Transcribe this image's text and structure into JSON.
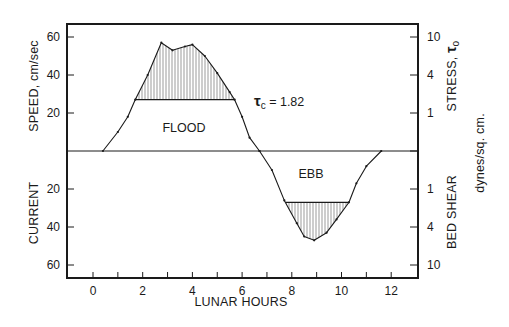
{
  "chart_data": {
    "type": "line",
    "title": "",
    "xlabel": "LUNAR HOURS",
    "ylabel_left_top": "SPEED, cm/sec",
    "ylabel_left_bottom": "CURRENT",
    "ylabel_right_top": "STRESS, τo",
    "ylabel_right_bottom": "BED SHEAR",
    "ylabel_right_units": "dynes/sq. cm.",
    "xlim": [
      -1,
      13
    ],
    "ylim": [
      -68,
      68
    ],
    "x_ticks": [
      0,
      2,
      4,
      6,
      8,
      10,
      12
    ],
    "x_minor_ticks": [
      0,
      1,
      2,
      3,
      4,
      5,
      6,
      7,
      8,
      9,
      10,
      11,
      12
    ],
    "y_ticks_left_flood": [
      20,
      40,
      60
    ],
    "y_ticks_left_ebb": [
      20,
      40,
      60
    ],
    "y_ticks_right_flood": [
      {
        "label": "1",
        "speed": 20
      },
      {
        "label": "4",
        "speed": 40
      },
      {
        "label": "10",
        "speed": 60
      }
    ],
    "y_ticks_right_ebb": [
      {
        "label": "1",
        "speed": 20
      },
      {
        "label": "4",
        "speed": 40
      },
      {
        "label": "10",
        "speed": 60
      }
    ],
    "grid": false,
    "threshold_speed": 27,
    "annotations": [
      {
        "text": "FLOOD",
        "x": 3.9,
        "y": 12
      },
      {
        "text": "EBB",
        "x": 8.8,
        "y": -14
      },
      {
        "text": "τc = 1.82",
        "x": 6.5,
        "y": 27
      }
    ],
    "series": [
      {
        "name": "Flood",
        "x": [
          0.4,
          1.0,
          1.4,
          1.7,
          2.2,
          2.75,
          3.2,
          3.7,
          4.0,
          4.5,
          5.0,
          5.5,
          5.7,
          6.0,
          6.3,
          6.7
        ],
        "values": [
          0,
          10,
          18,
          27,
          40,
          57,
          53,
          55,
          56,
          50,
          41,
          31,
          27,
          18,
          7,
          0
        ]
      },
      {
        "name": "Ebb",
        "x": [
          6.7,
          7.2,
          7.7,
          8.2,
          8.5,
          8.9,
          9.4,
          9.8,
          10.3,
          10.6,
          11.0,
          11.6
        ],
        "values": [
          0,
          -10,
          -26,
          -38,
          -45,
          -47,
          -43,
          -36,
          -27,
          -17,
          -8,
          0
        ]
      }
    ]
  },
  "labels": {
    "flood": "FLOOD",
    "ebb": "EBB",
    "tau_symbol": "τ",
    "tau_sub": "c",
    "tau_value": " = 1.82",
    "speed_title": "SPEED, cm/sec",
    "current_title": "CURRENT",
    "stress_title": "STRESS, ",
    "stress_tau": "τ",
    "stress_sub": "o",
    "bedshear_title": "BED SHEAR",
    "units_title": "dynes/sq. cm.",
    "x_title": "LUNAR HOURS"
  },
  "colors": {
    "ink": "#1a1a1a",
    "background": "#ffffff"
  }
}
